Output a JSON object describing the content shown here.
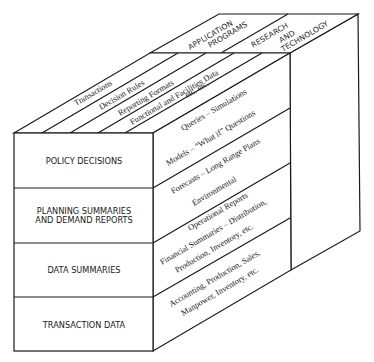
{
  "diagram": {
    "type": "3d-block-cube",
    "front_face": {
      "layers": [
        {
          "line1": "POLICY DECISIONS",
          "line2": ""
        },
        {
          "line1": "PLANNING SUMMARIES",
          "line2": "AND DEMAND REPORTS"
        },
        {
          "line1": "DATA SUMMARIES",
          "line2": ""
        },
        {
          "line1": "TRANSACTION DATA",
          "line2": ""
        }
      ]
    },
    "side_face": {
      "layers": [
        {
          "line1": "Queries – Simulations",
          "line2": "Models  – “What if” Questions"
        },
        {
          "line1": "Forecasts – Long Range Plans",
          "line2": "Environmental"
        },
        {
          "line1": "Operational Reports",
          "line2": "Financial Summaries – Distribution,",
          "line3": "Production, Inventory, etc."
        },
        {
          "line1": "Accounting, Production, Sales,",
          "line2": "Manpower, Inventory, etc."
        }
      ]
    },
    "top_face": {
      "strips": [
        "Transactions",
        "Decision Rules",
        "Reporting Formats",
        "Functional and Facilities Data",
        "etc.   etc."
      ],
      "application_programs": {
        "line1": "APPLICATION",
        "line2": "PROGRAMS"
      },
      "research_technology": {
        "line1": "RESEARCH",
        "line2": "AND",
        "line3": "TECHNOLOGY"
      }
    }
  }
}
